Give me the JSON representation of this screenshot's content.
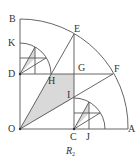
{
  "figure": {
    "caption_main": "R",
    "caption_sub": "2",
    "colors": {
      "stroke": "#555555",
      "shade": "#d9d9d9",
      "text": "#333333"
    },
    "points": {
      "O": {
        "label": "O",
        "x": 20,
        "y": 129
      },
      "A": {
        "label": "A",
        "x": 127,
        "y": 129
      },
      "B": {
        "label": "B",
        "x": 20,
        "y": 19
      },
      "C": {
        "label": "C",
        "x": 74,
        "y": 129
      },
      "D": {
        "label": "D",
        "x": 20,
        "y": 74
      },
      "E": {
        "label": "E",
        "x": 74,
        "y": 34
      },
      "F": {
        "label": "F",
        "x": 113,
        "y": 74
      },
      "G": {
        "label": "G",
        "x": 74,
        "y": 74
      },
      "H": {
        "label": "H",
        "x": 51,
        "y": 74
      },
      "I": {
        "label": "I",
        "x": 74,
        "y": 98
      },
      "J": {
        "label": "J",
        "x": 88,
        "y": 129
      },
      "K": {
        "label": "K",
        "x": 20,
        "y": 43
      }
    }
  }
}
